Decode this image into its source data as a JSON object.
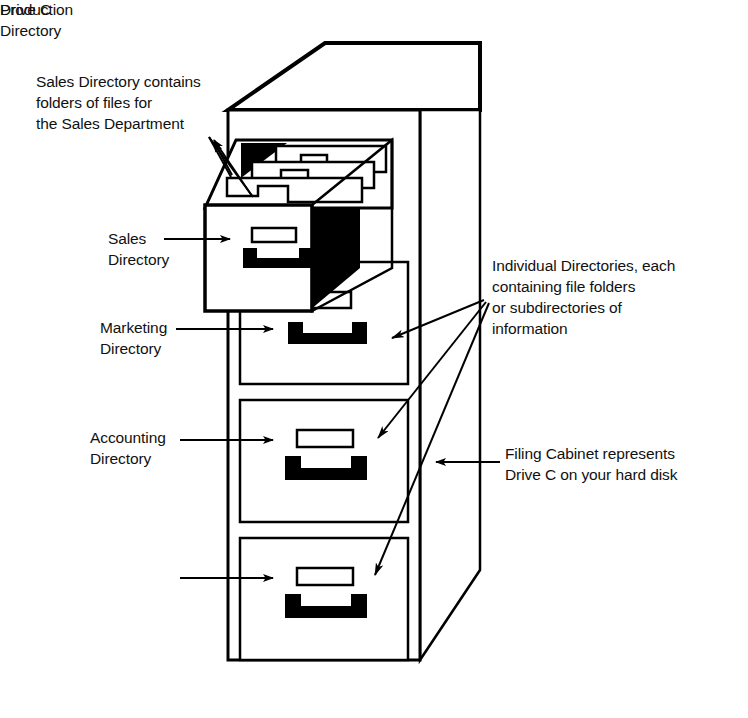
{
  "diagram": {
    "title_on_cabinet": "Drive C",
    "annotations": {
      "sales_description": "Sales Directory contains\nfolders of files for\nthe Sales Department",
      "individual_directories": "Individual Directories, each\ncontaining file folders\nor subdirectories of\ninformation",
      "filing_cabinet": "Filing Cabinet represents\nDrive C on your hard disk"
    },
    "drawer_labels": {
      "sales": "Sales\nDirectory",
      "marketing": "Marketing\nDirectory",
      "accounting": "Accounting\nDirectory",
      "production": "Production\nDirectory"
    },
    "colors": {
      "ink": "#000000",
      "paper": "#ffffff",
      "shadow": "#000000"
    }
  }
}
